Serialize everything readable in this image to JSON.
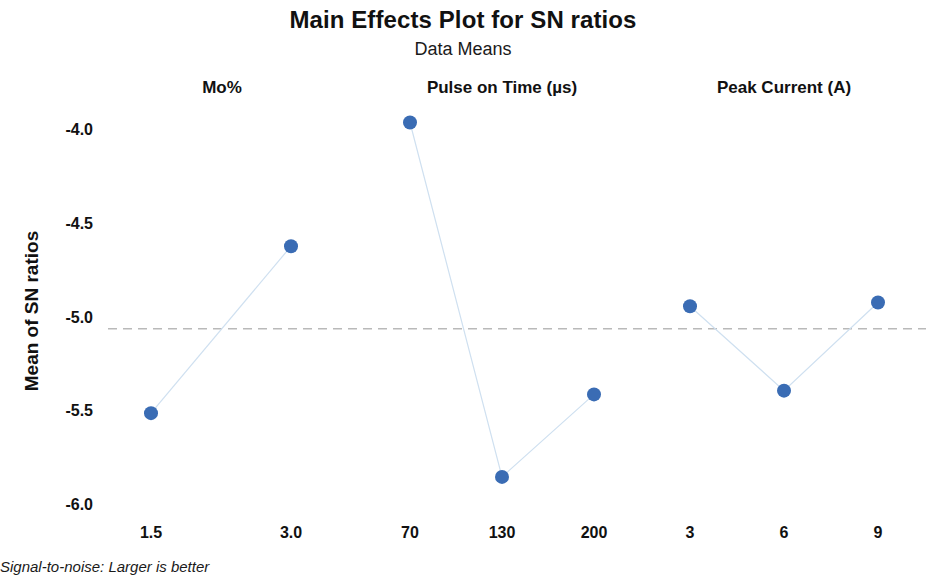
{
  "chart_data": {
    "type": "line",
    "title": "Main Effects Plot for SN ratios",
    "subtitle": "Data Means",
    "ylabel": "Mean of SN ratios",
    "xlabel": "",
    "ylim": [
      -6.0,
      -4.0
    ],
    "y_ticks": [
      "-4.0",
      "-4.5",
      "-5.0",
      "-5.5",
      "-6.0"
    ],
    "y_tick_values": [
      -4.0,
      -4.5,
      -5.0,
      -5.5,
      -6.0
    ],
    "grid": false,
    "legend": "none",
    "reference_line": -5.06,
    "footnote": "Signal-to-noise: Larger is better",
    "panels": [
      {
        "name": "Mo%",
        "categories": [
          "1.5",
          "3.0"
        ],
        "values": [
          -5.51,
          -4.62
        ]
      },
      {
        "name": "Pulse on Time (µs)",
        "categories": [
          "70",
          "130",
          "200"
        ],
        "values": [
          -3.96,
          -5.85,
          -5.41
        ]
      },
      {
        "name": "Peak Current (A)",
        "categories": [
          "3",
          "6",
          "9"
        ],
        "values": [
          -4.94,
          -5.39,
          -4.92
        ]
      }
    ],
    "colors": {
      "marker": "#3a6cb4",
      "line": "#cfe0f0",
      "reference_line": "#b9b9b9",
      "text": "#111111",
      "background": "#ffffff"
    }
  }
}
